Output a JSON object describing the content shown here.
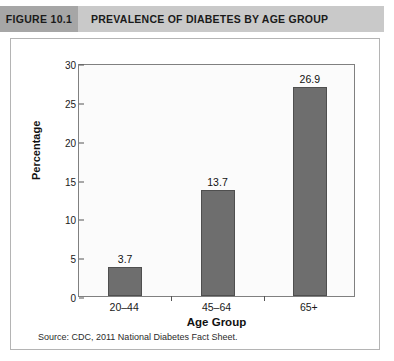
{
  "header": {
    "figure_number": "FIGURE 10.1",
    "figure_title": "PREVALENCE OF DIABETES BY AGE GROUP",
    "number_block_color": "#a6a6a6",
    "bar_color": "#c9c9c9"
  },
  "source_note": "Source: CDC, 2011 National Diabetes Fact Sheet.",
  "chart_data": {
    "type": "bar",
    "title": "PREVALENCE OF DIABETES BY AGE GROUP",
    "categories": [
      "20–44",
      "45–64",
      "65+"
    ],
    "values": [
      3.7,
      13.7,
      26.9
    ],
    "value_labels": [
      "3.7",
      "13.7",
      "26.9"
    ],
    "xlabel": "Age Group",
    "ylabel": "Percentage",
    "ylim": [
      0,
      30
    ],
    "yticks": [
      30,
      25,
      20,
      15,
      10,
      5,
      0
    ],
    "ytick_labels": [
      "30",
      "25",
      "20",
      "15",
      "10",
      "5",
      "0"
    ],
    "grid": false,
    "legend": false,
    "series_color": "#6e6e6e",
    "plot_background": "#fbfbfb"
  }
}
